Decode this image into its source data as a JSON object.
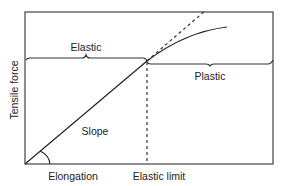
{
  "diagram": {
    "y_axis_label": "Tensile force",
    "x_axis_label": "Elongation",
    "regions": {
      "elastic": "Elastic",
      "plastic": "Plastic"
    },
    "annotations": {
      "slope": "Slope",
      "elastic_limit": "Elastic limit"
    },
    "colors": {
      "line": "#222222",
      "background": "#ffffff"
    }
  }
}
